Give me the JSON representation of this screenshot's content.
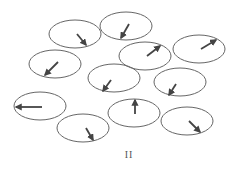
{
  "diagram": {
    "label": "II",
    "colors": {
      "ellipse_stroke": "#666666",
      "arrow": "#444444",
      "background": "#ffffff"
    },
    "domains": [
      {
        "id": "domain-1",
        "cx": 75,
        "cy": 34,
        "rx": 26,
        "ry": 14,
        "arrow": {
          "x1": 77,
          "y1": 34,
          "x2": 86,
          "y2": 45,
          "direction": "down-right"
        }
      },
      {
        "id": "domain-2",
        "cx": 126,
        "cy": 26,
        "rx": 26,
        "ry": 14,
        "arrow": {
          "x1": 129,
          "y1": 24,
          "x2": 121,
          "y2": 38,
          "direction": "down-left"
        }
      },
      {
        "id": "domain-3",
        "cx": 55,
        "cy": 64,
        "rx": 26,
        "ry": 14,
        "arrow": {
          "x1": 58,
          "y1": 62,
          "x2": 45,
          "y2": 75,
          "direction": "down-left"
        }
      },
      {
        "id": "domain-4",
        "cx": 145,
        "cy": 56,
        "rx": 26,
        "ry": 14,
        "arrow": {
          "x1": 147,
          "y1": 56,
          "x2": 160,
          "y2": 46,
          "direction": "up-right"
        }
      },
      {
        "id": "domain-5",
        "cx": 199,
        "cy": 49,
        "rx": 26,
        "ry": 14,
        "arrow": {
          "x1": 201,
          "y1": 49,
          "x2": 216,
          "y2": 40,
          "direction": "up-right"
        }
      },
      {
        "id": "domain-6",
        "cx": 114,
        "cy": 78,
        "rx": 26,
        "ry": 14,
        "arrow": {
          "x1": 111,
          "y1": 80,
          "x2": 103,
          "y2": 91,
          "direction": "down-left"
        }
      },
      {
        "id": "domain-7",
        "cx": 180,
        "cy": 82,
        "rx": 26,
        "ry": 14,
        "arrow": {
          "x1": 176,
          "y1": 84,
          "x2": 169,
          "y2": 95,
          "direction": "down-left"
        }
      },
      {
        "id": "domain-8",
        "cx": 40,
        "cy": 106,
        "rx": 26,
        "ry": 14,
        "arrow": {
          "x1": 42,
          "y1": 107,
          "x2": 16,
          "y2": 107,
          "direction": "left"
        }
      },
      {
        "id": "domain-9",
        "cx": 134,
        "cy": 113,
        "rx": 26,
        "ry": 14,
        "arrow": {
          "x1": 135,
          "y1": 114,
          "x2": 135,
          "y2": 100,
          "direction": "up"
        }
      },
      {
        "id": "domain-10",
        "cx": 83,
        "cy": 128,
        "rx": 26,
        "ry": 14,
        "arrow": {
          "x1": 86,
          "y1": 128,
          "x2": 93,
          "y2": 140,
          "direction": "down-right"
        }
      },
      {
        "id": "domain-11",
        "cx": 187,
        "cy": 121,
        "rx": 26,
        "ry": 14,
        "arrow": {
          "x1": 189,
          "y1": 121,
          "x2": 200,
          "y2": 132,
          "direction": "down-right"
        }
      }
    ]
  }
}
